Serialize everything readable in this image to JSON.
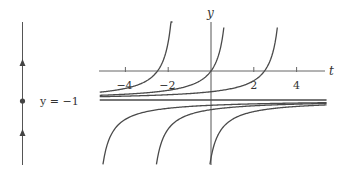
{
  "chart_data": [
    {
      "type": "line",
      "name": "phase-line",
      "title": "",
      "orientation": "vertical",
      "equilibrium": {
        "y": -1,
        "label": "y = −1",
        "kind": "node"
      },
      "arrows": [
        {
          "region": "above equilibrium",
          "direction": "up"
        },
        {
          "region": "below equilibrium",
          "direction": "up"
        }
      ]
    },
    {
      "type": "line",
      "name": "slope-solutions",
      "title": "",
      "xlabel": "t",
      "ylabel": "y",
      "xlim": [
        -5.2,
        5.4
      ],
      "ylim": [
        -3.3,
        1.7
      ],
      "xticks": [
        -4,
        -2,
        2,
        4
      ],
      "xtick_labels": [
        "−4",
        "−2",
        "2",
        "4"
      ],
      "grid": false,
      "legend": null,
      "equilibrium_solution": {
        "y": -1
      },
      "solution_family": "y = -1 - 1/(t - c)",
      "series": [
        {
          "name": "upper c=-1.5",
          "c": -1.5,
          "branch": "left",
          "t_range": [
            -5.2,
            -1.8
          ],
          "points": [
            [
              -5.0,
              -0.71
            ],
            [
              -4.0,
              -0.6
            ],
            [
              -3.0,
              -0.33
            ],
            [
              -2.5,
              0.0
            ],
            [
              -2.0,
              1.0
            ],
            [
              -1.8,
              2.33
            ]
          ]
        },
        {
          "name": "upper c=1",
          "c": 1,
          "branch": "left",
          "t_range": [
            -5.2,
            0.6
          ],
          "points": [
            [
              -5.0,
              -0.83
            ],
            [
              -2.0,
              -0.67
            ],
            [
              0.0,
              0.0
            ],
            [
              0.4,
              0.67
            ],
            [
              0.6,
              1.5
            ]
          ]
        },
        {
          "name": "upper c=3.5",
          "c": 3.5,
          "branch": "left",
          "t_range": [
            -5.2,
            3.1
          ],
          "points": [
            [
              -5.0,
              -0.88
            ],
            [
              0.0,
              -0.71
            ],
            [
              2.0,
              -0.33
            ],
            [
              2.5,
              0.0
            ],
            [
              3.0,
              1.0
            ]
          ]
        },
        {
          "name": "lower c=-5.5",
          "c": -5.5,
          "branch": "right",
          "t_range": [
            -5.05,
            5.4
          ],
          "points": [
            [
              -5.05,
              -3.22
            ],
            [
              -4.0,
              -1.67
            ],
            [
              0.0,
              -1.18
            ],
            [
              5.0,
              -1.1
            ]
          ]
        },
        {
          "name": "lower c=-3",
          "c": -3,
          "branch": "right",
          "t_range": [
            -2.55,
            5.4
          ],
          "points": [
            [
              -2.55,
              -3.22
            ],
            [
              -2.0,
              -2.0
            ],
            [
              0.0,
              -1.33
            ],
            [
              5.0,
              -1.13
            ]
          ]
        },
        {
          "name": "lower c=-0.5",
          "c": -0.5,
          "branch": "right",
          "t_range": [
            -0.05,
            5.4
          ],
          "points": [
            [
              -0.05,
              -3.22
            ],
            [
              0.5,
              -2.0
            ],
            [
              2.0,
              -1.4
            ],
            [
              5.0,
              -1.18
            ]
          ]
        }
      ]
    }
  ],
  "labels": {
    "phase_equilibrium": "y = −1",
    "y_axis": "y",
    "t_axis": "t",
    "ticks": [
      "−4",
      "−2",
      "2",
      "4"
    ]
  },
  "colors": {
    "curve": "#4a4a4a",
    "axis": "#555555",
    "text": "#333333"
  }
}
